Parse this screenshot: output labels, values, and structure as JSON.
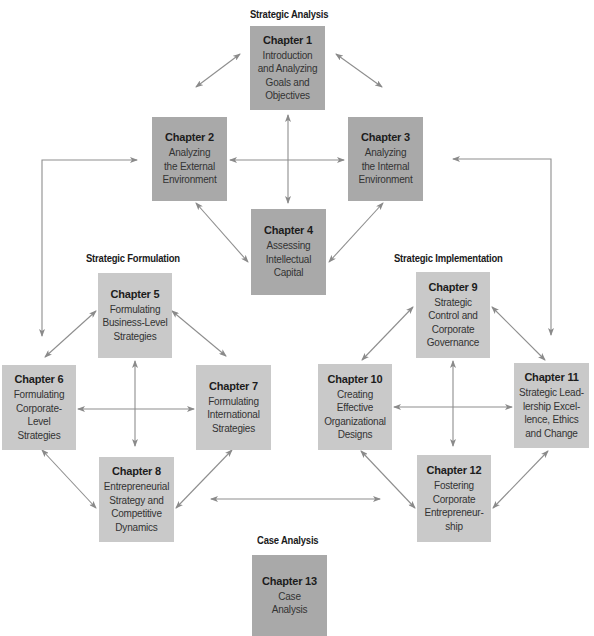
{
  "sections": {
    "analysis": "Strategic Analysis",
    "formulation": "Strategic Formulation",
    "implementation": "Strategic Implementation",
    "case": "Case Analysis"
  },
  "chapters": [
    {
      "num": "Chapter 1",
      "title": "Introduction\nand Analyzing\nGoals and\nObjectives",
      "group": "analysis"
    },
    {
      "num": "Chapter 2",
      "title": "Analyzing\nthe External\nEnvironment",
      "group": "analysis"
    },
    {
      "num": "Chapter 3",
      "title": "Analyzing\nthe Internal\nEnvironment",
      "group": "analysis"
    },
    {
      "num": "Chapter 4",
      "title": "Assessing\nIntellectual\nCapital",
      "group": "analysis"
    },
    {
      "num": "Chapter 5",
      "title": "Formulating\nBusiness-Level\nStrategies",
      "group": "formulation"
    },
    {
      "num": "Chapter 6",
      "title": "Formulating\nCorporate-\nLevel\nStrategies",
      "group": "formulation"
    },
    {
      "num": "Chapter 7",
      "title": "Formulating\nInternational\nStrategies",
      "group": "formulation"
    },
    {
      "num": "Chapter 8",
      "title": "Entrepreneurial\nStrategy and\nCompetitive\nDynamics",
      "group": "formulation"
    },
    {
      "num": "Chapter 9",
      "title": "Strategic\nControl and\nCorporate\nGovernance",
      "group": "implementation"
    },
    {
      "num": "Chapter 10",
      "title": "Creating\nEffective\nOrganizational\nDesigns",
      "group": "implementation"
    },
    {
      "num": "Chapter 11",
      "title": "Strategic Lead-\nlership Excel-\nlence, Ethics\nand Change",
      "group": "implementation"
    },
    {
      "num": "Chapter 12",
      "title": "Fostering\nCorporate\nEntrepreneur-\nship",
      "group": "implementation"
    },
    {
      "num": "Chapter 13",
      "title": "Case\nAnalysis",
      "group": "case"
    }
  ],
  "colors": {
    "analysis_box": "#a9a9a9",
    "phase_box": "#c9c9c9",
    "arrow": "#8a8a8a"
  }
}
